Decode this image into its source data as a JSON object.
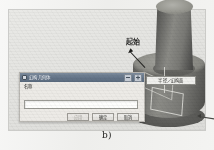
{
  "figure": {
    "caption": "b)"
  },
  "viewport": {
    "name": "cad-3d-viewport"
  },
  "annotations": {
    "start_label": "起始",
    "face_label": "半径／幻构面"
  },
  "dialog": {
    "title": "幻构几何体",
    "icon": "dialog-app-icon",
    "minimize_label": "_",
    "close_label": "×",
    "field_label": "名称",
    "field_value": "",
    "field_placeholder": "",
    "buttons": [
      {
        "label": "应用",
        "state": "disabled"
      },
      {
        "label": "确定",
        "state": "enabled"
      },
      {
        "label": "取消",
        "state": "enabled"
      }
    ]
  },
  "colors": {
    "titlebar": "#66768a",
    "dialog_face": "#eceae6",
    "model_light": "#8b8b86",
    "model_dark": "#4c4c49",
    "page_background": "#efefed"
  }
}
